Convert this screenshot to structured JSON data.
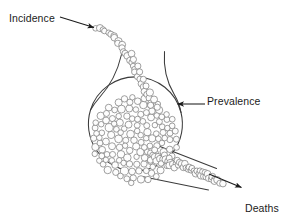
{
  "diagram": {
    "type": "flow-reservoir",
    "background_color": "#ffffff",
    "stroke_color": "#6f6f6f",
    "vessel_stroke_color": "#3b3b3b",
    "arrow_color": "#1b1b1b",
    "text_color": "#1b1b1b",
    "labels": {
      "incidence": "Incidence",
      "prevalence": "Prevalence",
      "deaths": "Deaths",
      "cures": "Cures"
    },
    "annotations": [
      {
        "name": "incidence-arrow",
        "label": "Incidence",
        "points_to": "inflow-stream",
        "direction": "down-right",
        "x1": 60,
        "y1": 17,
        "x2": 95,
        "y2": 28
      },
      {
        "name": "prevalence-arrow",
        "label": "Prevalence",
        "points_to": "prevalence-pool",
        "direction": "left",
        "x1": 205,
        "y1": 104,
        "x2": 176,
        "y2": 104
      },
      {
        "name": "deaths-cures-arrow",
        "label": "Deaths Cures",
        "points_to": "outflow-tube",
        "direction": "down-right",
        "x1": 209,
        "y1": 174,
        "x2": 243,
        "y2": 188
      }
    ],
    "pool": {
      "name": "prevalence-pool",
      "cx": 135,
      "cy": 140,
      "r": 47,
      "particle_count": 152,
      "particle_radius": 3.3
    },
    "inflow": {
      "name": "incidence-stream",
      "particle_count": 29,
      "particle_radius": 3.2,
      "from": {
        "x": 97,
        "y": 28
      },
      "to": {
        "x": 152,
        "y": 104
      }
    },
    "outflow": {
      "name": "deaths-cures-tube",
      "particle_count": 26,
      "particle_radius": 3.2,
      "from": {
        "x": 152,
        "y": 152
      },
      "to": {
        "x": 216,
        "y": 180
      }
    },
    "funnel": {
      "name": "funnel-neck",
      "left_wall": {
        "x1": 122,
        "y1": 55,
        "x2": 96,
        "y2": 110
      },
      "right_wall": {
        "x1": 164,
        "y1": 52,
        "x2": 178,
        "y2": 112
      }
    }
  }
}
